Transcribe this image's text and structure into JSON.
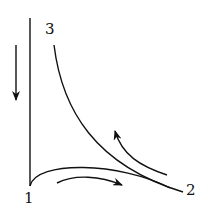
{
  "diagram": {
    "type": "cycle-diagram",
    "labels": {
      "point1": "1",
      "point2": "2",
      "point3": "3"
    },
    "elements": [
      {
        "name": "vertical-axis-line",
        "from": "1",
        "to": "top"
      },
      {
        "name": "curve-3-to-2",
        "from": "3",
        "to": "2"
      },
      {
        "name": "curve-1-to-2",
        "from": "1",
        "to": "2"
      },
      {
        "name": "arrow-down",
        "direction": "down"
      },
      {
        "name": "arrow-1-to-2",
        "direction": "right"
      },
      {
        "name": "arrow-2-to-3",
        "direction": "up-left"
      }
    ],
    "colors": {
      "stroke": "#111111",
      "background": "#ffffff"
    }
  }
}
